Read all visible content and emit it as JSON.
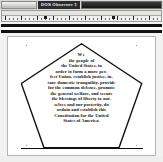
{
  "window": {
    "title": "DOS Observer 1",
    "title_bg": "#2b2b2b",
    "title_fg": "#f0f0ee",
    "chrome_bg": "#d8d8d6"
  },
  "ruler": {
    "name": "horizontal-ruler",
    "tab_marker_positions": [
      42,
      110
    ],
    "major_tick_spacing": 16,
    "minor_tick_spacing": 4
  },
  "toolbar": {
    "bars": [
      "toolbar-bar-upper",
      "toolbar-bar-lower"
    ],
    "color": "#111111"
  },
  "document": {
    "shape": "pentagon",
    "page_bg": "#ffffff",
    "text_color": "#111111",
    "title_line": "We",
    "lines": [
      "We",
      "the people of",
      "the United States, in",
      "order to form a more per-",
      "fect Union, establish justice, in-",
      "sure domestic tranquility, provide",
      "for the common defense, promote",
      "the general welfare, and secure",
      "the blessings of liberty to our-",
      "selves and our posterity, do",
      "ordain and establish this",
      "Constitution for the United",
      "States of America."
    ],
    "full_text": "We the people of the United States, in order to form a more perfect Union, establish justice, insure domestic tranquility, provide for the common defense, promote the general welfare, and secure the blessings of liberty to ourselves and our posterity, do ordain and establish this Constitution for the United States of America."
  }
}
